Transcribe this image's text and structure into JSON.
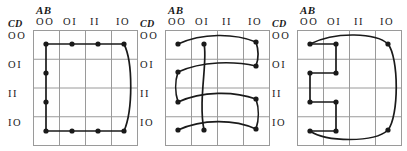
{
  "figure": {
    "kind": "karnaugh-map-triplet",
    "background_color": "#ffffff",
    "grid_color": "#9a9a9a",
    "ink_color": "#1a1a1a",
    "axis_labels": {
      "columns": "AB",
      "rows": "CD"
    },
    "column_headers": [
      "OO",
      "OI",
      "II",
      "IO"
    ],
    "row_headers": [
      "OO",
      "OI",
      "II",
      "IO"
    ]
  },
  "maps": [
    {
      "id": "kmap-1",
      "index": 1,
      "axis_labels": {
        "columns": "AB",
        "rows": "CD"
      },
      "column_headers": [
        "OO",
        "OI",
        "II",
        "IO"
      ],
      "row_headers": [
        "OO",
        "OI",
        "II",
        "IO"
      ],
      "cells_marked": [
        {
          "col": "OO",
          "row": "OO"
        },
        {
          "col": "OI",
          "row": "OO"
        },
        {
          "col": "II",
          "row": "OO"
        },
        {
          "col": "IO",
          "row": "OO"
        },
        {
          "col": "OO",
          "row": "OI"
        },
        {
          "col": "OO",
          "row": "II"
        },
        {
          "col": "OO",
          "row": "IO"
        },
        {
          "col": "OI",
          "row": "IO"
        },
        {
          "col": "II",
          "row": "IO"
        },
        {
          "col": "IO",
          "row": "IO"
        }
      ],
      "groups": [
        {
          "name": "top-row-group",
          "shape": "horizontal-row-loop",
          "row": "OO",
          "cols": [
            "OO",
            "OI",
            "II",
            "IO"
          ]
        },
        {
          "name": "left-column-group",
          "shape": "vertical-column-loop",
          "col": "OO",
          "rows": [
            "OO",
            "OI",
            "II",
            "IO"
          ]
        },
        {
          "name": "bottom-row-group",
          "shape": "horizontal-row-loop",
          "row": "IO",
          "cols": [
            "OO",
            "OI",
            "II",
            "IO"
          ]
        },
        {
          "name": "right-column-wrap-group",
          "shape": "vertical-column-loop",
          "col": "IO",
          "rows": [
            "OO",
            "IO"
          ]
        }
      ]
    },
    {
      "id": "kmap-2",
      "index": 2,
      "axis_labels": {
        "columns": "AB",
        "rows": "CD"
      },
      "column_headers": [
        "OO",
        "OI",
        "II",
        "IO"
      ],
      "row_headers": [
        "OO",
        "OI",
        "II",
        "IO"
      ],
      "cells_marked": [
        {
          "col": "OO",
          "row": "OO"
        },
        {
          "col": "OI",
          "row": "OO"
        },
        {
          "col": "IO",
          "row": "OO"
        },
        {
          "col": "OO",
          "row": "OI"
        },
        {
          "col": "IO",
          "row": "OI"
        },
        {
          "col": "OO",
          "row": "II"
        },
        {
          "col": "IO",
          "row": "II"
        },
        {
          "col": "OO",
          "row": "IO"
        },
        {
          "col": "OI",
          "row": "IO"
        },
        {
          "col": "IO",
          "row": "IO"
        }
      ],
      "groups": [
        {
          "name": "row-OO-wrap-group",
          "shape": "horizontal-wrap-loop",
          "row": "OO",
          "cols": [
            "OO",
            "IO"
          ]
        },
        {
          "name": "row-OI-wrap-group",
          "shape": "horizontal-wrap-loop",
          "row": "OI",
          "cols": [
            "OO",
            "IO"
          ]
        },
        {
          "name": "row-II-wrap-group",
          "shape": "horizontal-wrap-loop",
          "row": "II",
          "cols": [
            "OO",
            "IO"
          ]
        },
        {
          "name": "row-IO-wrap-group",
          "shape": "horizontal-wrap-loop",
          "row": "IO",
          "cols": [
            "OO",
            "IO"
          ]
        },
        {
          "name": "column-OI-group",
          "shape": "vertical-column-loop",
          "col": "OI",
          "rows": [
            "OO",
            "IO"
          ]
        }
      ]
    },
    {
      "id": "kmap-3",
      "index": 3,
      "axis_labels": {
        "columns": "AB",
        "rows": "CD"
      },
      "column_headers": [
        "OO",
        "OI",
        "II",
        "IO"
      ],
      "row_headers": [
        "OO",
        "OI",
        "II",
        "IO"
      ],
      "cells_marked": [
        {
          "col": "OO",
          "row": "OO"
        },
        {
          "col": "OI",
          "row": "OO"
        },
        {
          "col": "IO",
          "row": "OO"
        },
        {
          "col": "OO",
          "row": "OI"
        },
        {
          "col": "OI",
          "row": "OI"
        },
        {
          "col": "OO",
          "row": "II"
        },
        {
          "col": "OI",
          "row": "II"
        },
        {
          "col": "OO",
          "row": "IO"
        },
        {
          "col": "OI",
          "row": "IO"
        },
        {
          "col": "IO",
          "row": "IO"
        }
      ],
      "groups": [
        {
          "name": "staircase-group",
          "shape": "zigzag-chain",
          "cols": [
            "OO",
            "OI"
          ],
          "rows": [
            "OO",
            "OI",
            "II",
            "IO"
          ]
        },
        {
          "name": "outer-wrap-oval-group",
          "shape": "wrap-around-oval",
          "cols": [
            "OO",
            "IO"
          ],
          "rows": [
            "OO",
            "IO"
          ]
        }
      ]
    }
  ]
}
